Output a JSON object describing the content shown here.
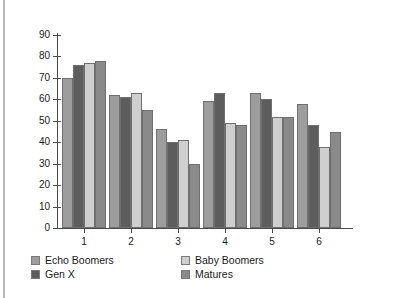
{
  "chart_data": {
    "type": "bar",
    "title": "",
    "subtitle": "",
    "xlabel": "",
    "ylabel": "",
    "categories": [
      "1",
      "2",
      "3",
      "4",
      "5",
      "6"
    ],
    "ylim": [
      0,
      90
    ],
    "yticks": [
      0,
      10,
      20,
      30,
      40,
      50,
      60,
      70,
      80,
      90
    ],
    "ytick_labels": [
      "0",
      "10",
      "20",
      "30",
      "40",
      "50",
      "60",
      "70",
      "80",
      "90"
    ],
    "grid": false,
    "legend_position": "bottom",
    "orientation": "vertical",
    "grouping": "grouped",
    "series": [
      {
        "name": "Echo Boomers",
        "color": "#9d9d9d",
        "values": [
          70,
          62,
          46,
          59,
          63,
          58
        ]
      },
      {
        "name": "Gen X",
        "color": "#5d5d5d",
        "values": [
          76,
          61,
          40,
          63,
          60,
          48
        ]
      },
      {
        "name": "Baby Boomers",
        "color": "#cfcfcf",
        "values": [
          77,
          63,
          41,
          49,
          52,
          38
        ]
      },
      {
        "name": "Matures",
        "color": "#8a8a8a",
        "values": [
          78,
          55,
          30,
          48,
          52,
          45
        ]
      }
    ]
  },
  "legend": {
    "items": [
      {
        "label": "Echo Boomers",
        "color": "#9d9d9d"
      },
      {
        "label": "Gen X",
        "color": "#5d5d5d"
      },
      {
        "label": "Baby Boomers",
        "color": "#cfcfcf"
      },
      {
        "label": "Matures",
        "color": "#8a8a8a"
      }
    ]
  },
  "colors": {
    "axis": "#4a4a4a",
    "bar_outline": "#6f6f6f",
    "frame_rule": "#b9b9b9",
    "background": "#ffffff",
    "text": "#1a1a1a"
  }
}
